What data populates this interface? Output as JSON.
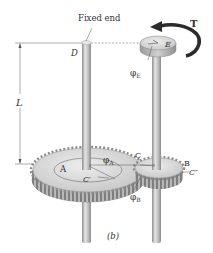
{
  "figure": {
    "caption": "(b)",
    "labels": {
      "fixed_end": "Fixed end",
      "D": "D",
      "E": "E",
      "T": "T",
      "L": "L",
      "phi_E": "φ",
      "phi_E_sub": "E",
      "phi_A": "φ",
      "phi_A_sub": "A",
      "phi_B": "φ",
      "phi_B_sub": "B",
      "A": "A",
      "B": "B",
      "C": "C",
      "C_prime": "C′",
      "C_double_prime": "C″"
    },
    "colors": {
      "shaft": "#c9c9c9",
      "shaft_shade": "#9a9a9a",
      "gear_top": "#dcdcdc",
      "gear_side": "#a8a8a8",
      "torque_arrow": "#2b2b2b",
      "text": "#333333"
    }
  }
}
